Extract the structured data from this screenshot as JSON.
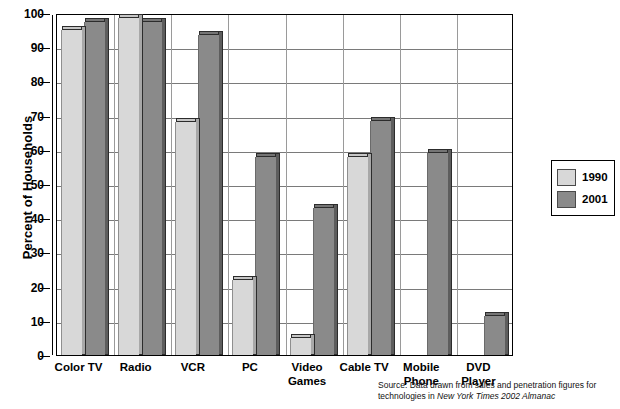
{
  "chart_data": {
    "type": "bar",
    "title": "",
    "subtitle": "",
    "xlabel": "",
    "ylabel": "Percent of Households",
    "ylim": [
      0,
      100
    ],
    "yticks": [
      0,
      10,
      20,
      30,
      40,
      50,
      60,
      70,
      80,
      90,
      100
    ],
    "grid": true,
    "legend_position": "right",
    "categories": [
      "Color TV",
      "Radio",
      "VCR",
      "PC",
      "Video Games",
      "Cable TV",
      "Mobile Phone",
      "DVD Player"
    ],
    "category_lines": [
      [
        "Color TV"
      ],
      [
        "Radio"
      ],
      [
        "VCR"
      ],
      [
        "PC"
      ],
      [
        "Video",
        "Games"
      ],
      [
        "Cable TV"
      ],
      [
        "Mobile",
        "Phone"
      ],
      [
        "DVD",
        "Player"
      ]
    ],
    "series": [
      {
        "name": "1990",
        "color": "#d8d8d8",
        "values": [
          95,
          98.5,
          68,
          22,
          5,
          58,
          0,
          0
        ]
      },
      {
        "name": "2001",
        "color": "#8a8a8a",
        "values": [
          97.5,
          97.5,
          93.5,
          58,
          43,
          68.5,
          59,
          11.5
        ]
      }
    ],
    "annotations": {
      "source_prefix": "Source: Data drawn from sales and penetration figures for technologies in",
      "source_italic": "New York Times 2002 Almanac"
    }
  },
  "legend": {
    "entries": [
      {
        "label": "1990"
      },
      {
        "label": "2001"
      }
    ]
  },
  "axes": {
    "y_title": "Percent of Households",
    "y_tick_labels": [
      "100",
      "90",
      "80",
      "70",
      "60",
      "50",
      "40",
      "30",
      "20",
      "10",
      "0"
    ]
  },
  "colors": {
    "series_1990": "#d8d8d8",
    "series_2001": "#8a8a8a",
    "axis": "#000000",
    "gridline": "#7a7a7a",
    "background": "#ffffff"
  }
}
